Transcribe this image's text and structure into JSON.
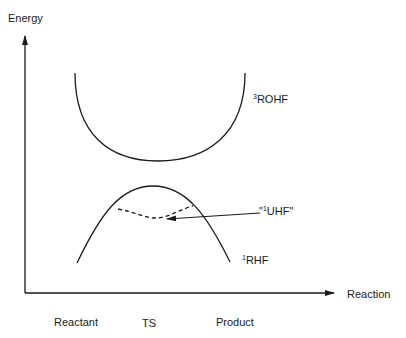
{
  "diagram": {
    "axes": {
      "y_label": "Energy",
      "x_label": "Reaction"
    },
    "x_ticks": [
      {
        "label": "Reactant"
      },
      {
        "label": "TS"
      },
      {
        "label": "Product"
      }
    ],
    "curves": {
      "triplet": {
        "superscript": "3",
        "name": "ROHF",
        "style": "solid"
      },
      "singlet_uhf": {
        "quote_open": "\"",
        "superscript": "1",
        "name": "UHF",
        "quote_close": "\"",
        "style": "dashed"
      },
      "singlet_rhf": {
        "superscript": "1",
        "name": "RHF",
        "style": "solid"
      }
    },
    "colors": {
      "line": "#1a1a1a",
      "background": "#ffffff"
    }
  }
}
